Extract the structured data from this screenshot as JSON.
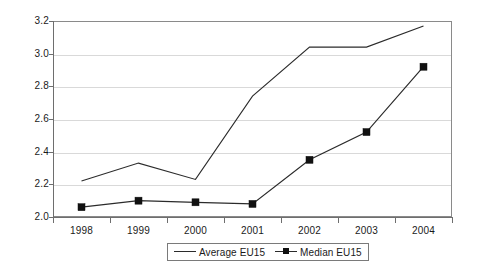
{
  "chart_data": {
    "type": "line",
    "title": "",
    "xlabel": "",
    "ylabel": "",
    "categories": [
      "1998",
      "1999",
      "2000",
      "2001",
      "2002",
      "2003",
      "2004"
    ],
    "ylim": [
      2.0,
      3.2
    ],
    "yticks": [
      "2.0",
      "2.2",
      "2.4",
      "2.6",
      "2.8",
      "3.0",
      "3.2"
    ],
    "ytick_values": [
      2.0,
      2.2,
      2.4,
      2.6,
      2.8,
      3.0,
      3.2
    ],
    "grid": "horizontal",
    "legend_position": "bottom-center",
    "series": [
      {
        "name": "Average EU15",
        "marker": "none",
        "color": "#2b2b2b",
        "values": [
          2.22,
          2.33,
          2.23,
          2.74,
          3.04,
          3.04,
          3.17
        ]
      },
      {
        "name": "Median EU15",
        "marker": "square",
        "color": "#111111",
        "values": [
          2.06,
          2.1,
          2.09,
          2.08,
          2.35,
          2.52,
          2.92
        ]
      }
    ]
  },
  "legend": {
    "entries": [
      {
        "label": "Average EU15"
      },
      {
        "label": "Median EU15"
      }
    ]
  }
}
